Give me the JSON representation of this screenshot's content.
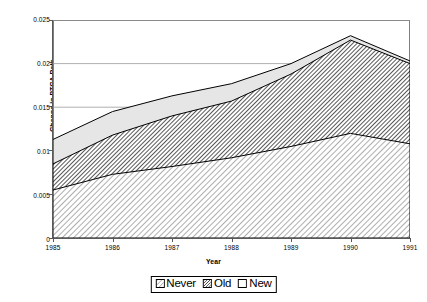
{
  "chart_data": {
    "type": "area",
    "stacked": true,
    "title": "",
    "xlabel": "Year",
    "ylabel": "Change in PTCA Rate",
    "categories": [
      "1985",
      "1986",
      "1987",
      "1988",
      "1989",
      "1990",
      "1991"
    ],
    "x": [
      1985,
      1986,
      1987,
      1988,
      1989,
      1990,
      1991
    ],
    "xlim": [
      1985,
      1991
    ],
    "ylim": [
      0,
      0.025
    ],
    "yticks": [
      "0",
      "0.005",
      "0.01",
      "0.015",
      "0.02",
      "0.025"
    ],
    "ytick_values": [
      0,
      0.005,
      0.01,
      0.015,
      0.02,
      0.025
    ],
    "grid": "horizontal",
    "legend_position": "bottom",
    "series": [
      {
        "name": "Never",
        "fill": "light-diagonal-hatch",
        "color": "#d9d9d9",
        "values": [
          0.0055,
          0.0073,
          0.0082,
          0.0092,
          0.0105,
          0.012,
          0.0108
        ],
        "cumulative": [
          0.0055,
          0.0073,
          0.0082,
          0.0092,
          0.0105,
          0.012,
          0.0108
        ]
      },
      {
        "name": "Old",
        "fill": "dense-diagonal-hatch",
        "color": "#8c8c8c",
        "values": [
          0.003,
          0.0045,
          0.0058,
          0.0065,
          0.0083,
          0.0107,
          0.0092
        ],
        "cumulative": [
          0.0085,
          0.0118,
          0.014,
          0.0157,
          0.0188,
          0.0227,
          0.02
        ]
      },
      {
        "name": "New",
        "fill": "solid-light-gray",
        "color": "#e8e8e8",
        "values": [
          0.0028,
          0.0027,
          0.0023,
          0.002,
          0.0012,
          0.0005,
          0.0003
        ],
        "cumulative": [
          0.0113,
          0.0145,
          0.0163,
          0.0177,
          0.02,
          0.0232,
          0.0203
        ]
      }
    ]
  },
  "legend": {
    "items": [
      {
        "label": "Never",
        "swatch": "light-diagonal-hatch-swatch"
      },
      {
        "label": "Old",
        "swatch": "dense-diagonal-hatch-swatch"
      },
      {
        "label": "New",
        "swatch": "solid-light-swatch"
      }
    ]
  },
  "axes": {
    "y_title": "Change in PTCA Rate",
    "x_title": "Year"
  }
}
